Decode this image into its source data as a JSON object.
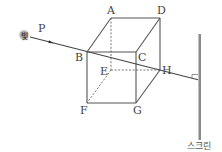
{
  "diagram": {
    "title": "",
    "light_source": {
      "label": "빛",
      "x": 24,
      "y": 35
    },
    "point_p": {
      "label": "P",
      "x": 38,
      "y": 31
    },
    "vertices": {
      "A": {
        "label": "A",
        "x": 111,
        "y": 18
      },
      "D": {
        "label": "D",
        "x": 160,
        "y": 18
      },
      "B": {
        "label": "B",
        "x": 87,
        "y": 52
      },
      "C": {
        "label": "C",
        "x": 136,
        "y": 52
      },
      "E": {
        "label": "E",
        "x": 111,
        "y": 70
      },
      "H": {
        "label": "H",
        "x": 160,
        "y": 70
      },
      "F": {
        "label": "F",
        "x": 87,
        "y": 103
      },
      "G": {
        "label": "G",
        "x": 136,
        "y": 103
      }
    },
    "screen": {
      "label": "스크린",
      "x": 199,
      "y_top": 34,
      "y_bottom": 140
    },
    "ray_end": {
      "x": 199,
      "y": 80
    },
    "colors": {
      "line": "#555555",
      "screen": "#888888",
      "light_glow": "#9a9a9a"
    }
  }
}
